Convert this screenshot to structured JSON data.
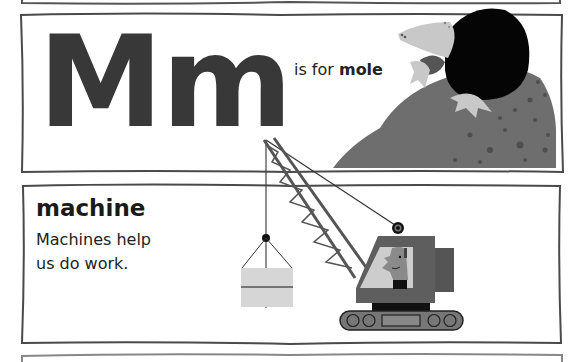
{
  "letter_panel": {
    "letter_upper": "M",
    "letter_lower": "m",
    "letters": "Mm",
    "is_for_prefix": "is for ",
    "is_for_word": "mole",
    "illustration": "mole-emerging-from-dirt-mound"
  },
  "word_panel": {
    "word": "machine",
    "description_line1": "Machines help",
    "description_line2": "us do work.",
    "illustration": "crane-lifting-crate"
  },
  "colors": {
    "frame": "#4a4a4a",
    "letter": "#383838",
    "mole_body": "#050505",
    "mole_snout": "#c8c8c8",
    "dirt": "#6e6e6e",
    "crane_body": "#5a5a5a",
    "crate": "#d6d6d6"
  }
}
